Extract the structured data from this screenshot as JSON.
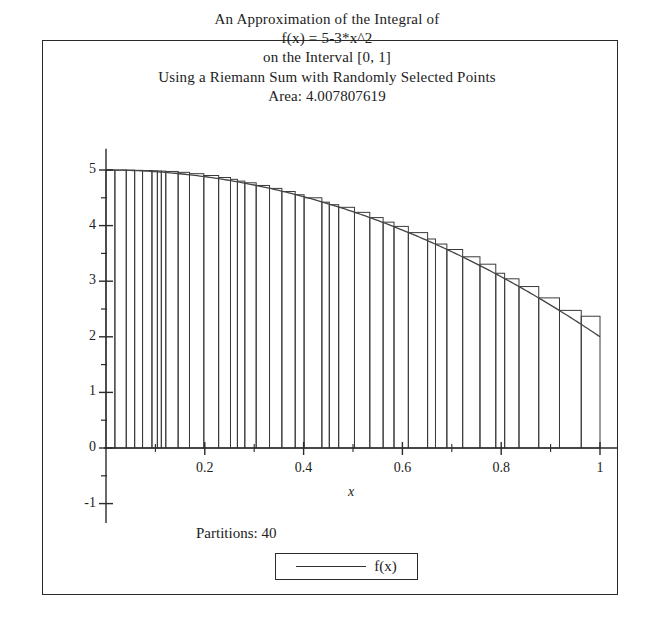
{
  "titles": {
    "line1": "An Approximation of the Integral of",
    "line2": "f(x) = 5-3*x^2",
    "line3": "on the Interval [0, 1]",
    "line4": "Using a Riemann Sum with Randomly Selected Points",
    "line5": "Area: 4.007807619"
  },
  "footer": {
    "partitions_label": "Partitions: 40",
    "legend_series_label": "f(x)"
  },
  "chart_data": {
    "type": "area",
    "title": "An Approximation of the Integral of f(x) = 5-3*x^2 on the Interval [0, 1]",
    "subtitle": "Using a Riemann Sum with Randomly Selected Points",
    "annotations": [
      "Area: 4.007807619",
      "Partitions: 40"
    ],
    "xlabel": "x",
    "ylabel": "",
    "xlim": [
      0,
      1.0
    ],
    "ylim": [
      -1,
      5.4
    ],
    "grid": false,
    "legend": [
      "f(x)"
    ],
    "legend_position": "bottom-center",
    "x_ticks": [
      0.2,
      0.4,
      0.6,
      0.8,
      1
    ],
    "x_tick_labels": [
      "0.2",
      "0.4",
      "0.6",
      "0.8",
      "1"
    ],
    "x_minor_ticks": [
      0.1,
      0.3,
      0.5,
      0.7,
      0.9
    ],
    "y_ticks": [
      -1,
      0,
      1,
      2,
      3,
      4,
      5
    ],
    "y_tick_labels": [
      "-1",
      "0",
      "1",
      "2",
      "3",
      "4",
      "5"
    ],
    "y_minor_ticks": [
      -0.5,
      0.5,
      1.5,
      2.5,
      3.5,
      4.5
    ],
    "function": {
      "expression": "5 - 3*x^2",
      "a": 5,
      "b": -3,
      "power": 2,
      "samples": 200
    },
    "riemann": {
      "n_partitions": 40,
      "method": "random sample point in each subinterval",
      "interval": [
        0,
        1
      ],
      "area": 4.007807619,
      "partition_edges": [
        0.0,
        0.018,
        0.041,
        0.058,
        0.074,
        0.093,
        0.104,
        0.112,
        0.121,
        0.146,
        0.169,
        0.198,
        0.228,
        0.252,
        0.266,
        0.281,
        0.304,
        0.331,
        0.356,
        0.383,
        0.401,
        0.437,
        0.452,
        0.471,
        0.503,
        0.534,
        0.561,
        0.583,
        0.612,
        0.651,
        0.667,
        0.69,
        0.722,
        0.757,
        0.789,
        0.807,
        0.836,
        0.876,
        0.918,
        0.962,
        1.0
      ],
      "sample_heights": [
        5.0,
        4.999,
        4.997,
        4.994,
        4.99,
        4.987,
        4.983,
        4.98,
        4.974,
        4.958,
        4.934,
        4.901,
        4.865,
        4.832,
        4.8,
        4.77,
        4.722,
        4.669,
        4.613,
        4.555,
        4.5,
        4.421,
        4.376,
        4.329,
        4.238,
        4.144,
        4.062,
        3.986,
        3.874,
        3.759,
        3.668,
        3.57,
        3.439,
        3.306,
        3.143,
        3.043,
        2.904,
        2.7,
        2.475,
        2.37
      ]
    }
  }
}
